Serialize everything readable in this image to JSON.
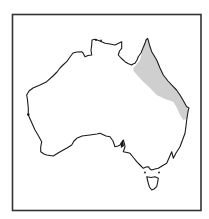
{
  "map": {
    "subject": "Australia",
    "style": "outline map with shaded distribution range",
    "frame": {
      "x": 12,
      "y": 14,
      "width": 189,
      "height": 197,
      "stroke": "#333333"
    },
    "colors": {
      "background": "#ffffff",
      "coastline": "#1a1a1a",
      "range_fill": "#cfcfcf"
    },
    "highlighted_region": {
      "label": "distribution range",
      "location": "north-eastern Queensland coast (Cape York to central Queensland)"
    },
    "landmasses": [
      "mainland-australia",
      "tasmania"
    ]
  }
}
